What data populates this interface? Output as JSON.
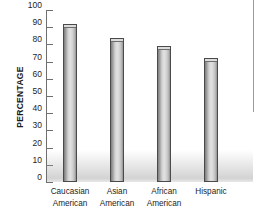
{
  "chart_data": {
    "type": "bar",
    "title": "",
    "subtitle": "",
    "xlabel": "",
    "ylabel": "PERCENTAGE",
    "ylim": [
      0,
      100
    ],
    "yticks": [
      0,
      10,
      20,
      30,
      40,
      50,
      60,
      70,
      80,
      90,
      100
    ],
    "ytick_labels": [
      "0",
      "10",
      "20",
      "30",
      "40",
      "50",
      "60",
      "70",
      "80",
      "90",
      "100"
    ],
    "grid": false,
    "legend": null,
    "legend_position": "none",
    "categories": [
      "Caucasian American",
      "Asian American",
      "African American",
      "Hispanic"
    ],
    "category_lines": [
      [
        "Caucasian",
        "American"
      ],
      [
        "Asian",
        "American"
      ],
      [
        "African",
        "American"
      ],
      [
        "Hispanic",
        ""
      ]
    ],
    "values": [
      92,
      84,
      79,
      72
    ],
    "colors": {
      "bar_fill_light": "#e2e2e2",
      "bar_fill_dark": "#7d7d7d",
      "bar_border": "#4a4a4a",
      "bar_cap": "#dcdcdc",
      "axis": "#6f6f6f",
      "text": "#1d1d1d",
      "background": "#ffffff"
    }
  }
}
